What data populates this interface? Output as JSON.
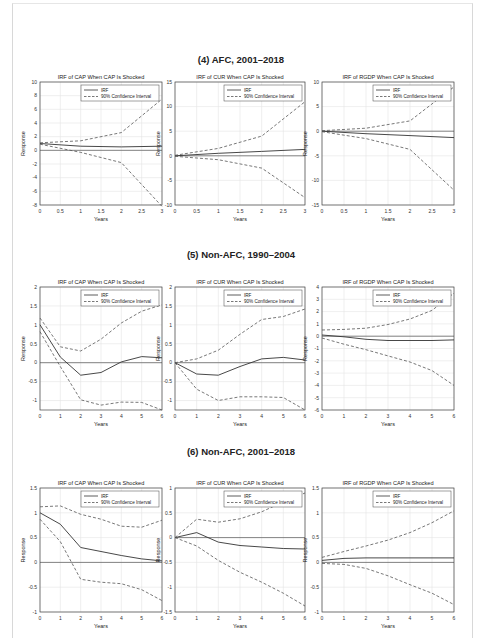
{
  "sections": [
    {
      "title": "(4) AFC, 2001–2018"
    },
    {
      "title": "(5) Non-AFC, 1990–2004"
    },
    {
      "title": "(6) Non-AFC, 2001–2018"
    }
  ],
  "legend": {
    "irf": "IRF",
    "ci": "90% Confidence Interval"
  },
  "chart_data": [
    {
      "type": "line",
      "section": "(4) AFC, 2001–2018",
      "title": "IRF of CAP When CAP Is Shocked",
      "xlabel": "Years",
      "ylabel": "Response",
      "xlim": [
        0,
        3
      ],
      "ylim": [
        -8,
        10
      ],
      "xticks": [
        0,
        0.5,
        1,
        1.5,
        2,
        2.5,
        3
      ],
      "yticks": [
        -8,
        -6,
        -4,
        -2,
        0,
        2,
        4,
        6,
        8,
        10
      ],
      "grid": true,
      "legend_position": "upper right",
      "x": [
        0,
        1,
        2,
        3
      ],
      "series": [
        {
          "name": "IRF",
          "values": [
            1,
            0.6,
            0.5,
            0.6
          ]
        },
        {
          "name": "90% Confidence Interval (upper)",
          "values": [
            1.1,
            1.4,
            2.6,
            7.5
          ]
        },
        {
          "name": "90% Confidence Interval (lower)",
          "values": [
            0.9,
            -0.3,
            -1.8,
            -8.2
          ]
        }
      ]
    },
    {
      "type": "line",
      "section": "(4) AFC, 2001–2018",
      "title": "IRF of CUR When CAP Is Shocked",
      "xlabel": "Years",
      "ylabel": "Response",
      "xlim": [
        0,
        3
      ],
      "ylim": [
        -10,
        15
      ],
      "xticks": [
        0,
        0.5,
        1,
        1.5,
        2,
        2.5,
        3
      ],
      "yticks": [
        -10,
        -5,
        0,
        5,
        10,
        15
      ],
      "grid": true,
      "legend_position": "upper right",
      "x": [
        0,
        1,
        2,
        3
      ],
      "series": [
        {
          "name": "IRF",
          "values": [
            0,
            0.5,
            0.9,
            1.3
          ]
        },
        {
          "name": "90% Confidence Interval (upper)",
          "values": [
            0.1,
            1.5,
            4,
            11
          ]
        },
        {
          "name": "90% Confidence Interval (lower)",
          "values": [
            -0.1,
            -0.8,
            -2.5,
            -8.5
          ]
        }
      ]
    },
    {
      "type": "line",
      "section": "(4) AFC, 2001–2018",
      "title": "IRF of RGDP When CAP Is Shocked",
      "xlabel": "Years",
      "ylabel": "Response",
      "xlim": [
        0,
        3
      ],
      "ylim": [
        -15,
        10
      ],
      "xticks": [
        0,
        0.5,
        1,
        1.5,
        2,
        2.5,
        3
      ],
      "yticks": [
        -15,
        -10,
        -5,
        0,
        5,
        10
      ],
      "grid": true,
      "legend_position": "upper right",
      "x": [
        0,
        1,
        2,
        3
      ],
      "series": [
        {
          "name": "IRF",
          "values": [
            0,
            -0.5,
            -0.9,
            -1.3
          ]
        },
        {
          "name": "90% Confidence Interval (upper)",
          "values": [
            0.1,
            0.6,
            2.1,
            9
          ]
        },
        {
          "name": "90% Confidence Interval (lower)",
          "values": [
            -0.1,
            -1.5,
            -3.7,
            -12
          ]
        }
      ]
    },
    {
      "type": "line",
      "section": "(5) Non-AFC, 1990–2004",
      "title": "IRF of CAP When CAP Is Shocked",
      "xlabel": "Years",
      "ylabel": "Response",
      "xlim": [
        0,
        6
      ],
      "ylim": [
        -1.25,
        2
      ],
      "xticks": [
        0,
        1,
        2,
        3,
        4,
        5,
        6
      ],
      "yticks": [
        -1,
        -0.5,
        0,
        0.5,
        1,
        1.5,
        2
      ],
      "grid": true,
      "legend_position": "upper right",
      "x": [
        0,
        1,
        2,
        3,
        4,
        5,
        6
      ],
      "series": [
        {
          "name": "IRF",
          "values": [
            1,
            0.15,
            -0.33,
            -0.26,
            0.02,
            0.16,
            0.13
          ]
        },
        {
          "name": "90% Confidence Interval (upper)",
          "values": [
            1.18,
            0.42,
            0.31,
            0.62,
            1.05,
            1.36,
            1.53
          ]
        },
        {
          "name": "90% Confidence Interval (lower)",
          "values": [
            0.82,
            -0.1,
            -0.98,
            -1.12,
            -1.04,
            -1.05,
            -1.25
          ]
        }
      ]
    },
    {
      "type": "line",
      "section": "(5) Non-AFC, 1990–2004",
      "title": "IRF of CUR When CAP Is Shocked",
      "xlabel": "Years",
      "ylabel": "Response",
      "xlim": [
        0,
        6
      ],
      "ylim": [
        -1.25,
        2
      ],
      "xticks": [
        0,
        1,
        2,
        3,
        4,
        5,
        6
      ],
      "yticks": [
        -1,
        -0.5,
        0,
        0.5,
        1,
        1.5,
        2
      ],
      "grid": true,
      "legend_position": "upper right",
      "x": [
        0,
        1,
        2,
        3,
        4,
        5,
        6
      ],
      "series": [
        {
          "name": "IRF",
          "values": [
            0,
            -0.3,
            -0.33,
            -0.1,
            0.1,
            0.14,
            0.07
          ]
        },
        {
          "name": "90% Confidence Interval (upper)",
          "values": [
            0,
            0.1,
            0.33,
            0.75,
            1.14,
            1.22,
            1.42
          ]
        },
        {
          "name": "90% Confidence Interval (lower)",
          "values": [
            0,
            -0.7,
            -1,
            -0.9,
            -0.9,
            -0.92,
            -1.25
          ]
        }
      ]
    },
    {
      "type": "line",
      "section": "(5) Non-AFC, 1990–2004",
      "title": "IRF of RGDP When CAP Is Shocked",
      "xlabel": "Years",
      "ylabel": "Response",
      "xlim": [
        0,
        6
      ],
      "ylim": [
        -6,
        4
      ],
      "xticks": [
        0,
        1,
        2,
        3,
        4,
        5,
        6
      ],
      "yticks": [
        -6,
        -5,
        -4,
        -3,
        -2,
        -1,
        0,
        1,
        2,
        3,
        4
      ],
      "grid": true,
      "legend_position": "upper right",
      "x": [
        0,
        1,
        2,
        3,
        4,
        5,
        6
      ],
      "series": [
        {
          "name": "IRF",
          "values": [
            0.1,
            -0.05,
            -0.25,
            -0.35,
            -0.35,
            -0.35,
            -0.3
          ]
        },
        {
          "name": "90% Confidence Interval (upper)",
          "values": [
            0.5,
            0.55,
            0.65,
            0.95,
            1.4,
            2.1,
            3.5
          ]
        },
        {
          "name": "90% Confidence Interval (lower)",
          "values": [
            -0.15,
            -0.65,
            -1.1,
            -1.6,
            -2.1,
            -2.8,
            -4
          ]
        }
      ]
    },
    {
      "type": "line",
      "section": "(6) Non-AFC, 2001–2018",
      "title": "IRF of CAP When CAP Is Shocked",
      "xlabel": "Years",
      "ylabel": "Response",
      "xlim": [
        0,
        6
      ],
      "ylim": [
        -1,
        1.5
      ],
      "xticks": [
        0,
        1,
        2,
        3,
        4,
        5,
        6
      ],
      "yticks": [
        -1,
        -0.5,
        0,
        0.5,
        1,
        1.5
      ],
      "grid": true,
      "legend_position": "upper right",
      "x": [
        0,
        1,
        2,
        3,
        4,
        5,
        6
      ],
      "series": [
        {
          "name": "IRF",
          "values": [
            1,
            0.77,
            0.3,
            0.22,
            0.14,
            0.07,
            0.03
          ]
        },
        {
          "name": "90% Confidence Interval (upper)",
          "values": [
            1.12,
            1.14,
            0.97,
            0.87,
            0.73,
            0.71,
            0.85
          ]
        },
        {
          "name": "90% Confidence Interval (lower)",
          "values": [
            0.87,
            0.42,
            -0.34,
            -0.4,
            -0.43,
            -0.55,
            -0.77
          ]
        }
      ]
    },
    {
      "type": "line",
      "section": "(6) Non-AFC, 2001–2018",
      "title": "IRF of CUR When CAP Is Shocked",
      "xlabel": "Years",
      "ylabel": "Response",
      "xlim": [
        0,
        6
      ],
      "ylim": [
        -1.5,
        1
      ],
      "xticks": [
        0,
        1,
        2,
        3,
        4,
        5,
        6
      ],
      "yticks": [
        -1.5,
        -1,
        -0.5,
        0,
        0.5,
        1
      ],
      "grid": true,
      "legend_position": "upper right",
      "x": [
        0,
        1,
        2,
        3,
        4,
        5,
        6
      ],
      "series": [
        {
          "name": "IRF",
          "values": [
            0,
            0.1,
            -0.09,
            -0.16,
            -0.19,
            -0.22,
            -0.23
          ]
        },
        {
          "name": "90% Confidence Interval (upper)",
          "values": [
            0,
            0.37,
            0.31,
            0.38,
            0.52,
            0.72,
            0.9
          ]
        },
        {
          "name": "90% Confidence Interval (lower)",
          "values": [
            0,
            -0.17,
            -0.46,
            -0.7,
            -0.9,
            -1.12,
            -1.38
          ]
        }
      ]
    },
    {
      "type": "line",
      "section": "(6) Non-AFC, 2001–2018",
      "title": "IRF of RGDP When CAP Is Shocked",
      "xlabel": "Years",
      "ylabel": "Response",
      "xlim": [
        0,
        6
      ],
      "ylim": [
        -1,
        1.5
      ],
      "xticks": [
        0,
        1,
        2,
        3,
        4,
        5,
        6
      ],
      "yticks": [
        -1,
        -0.5,
        0,
        0.5,
        1,
        1.5
      ],
      "grid": true,
      "legend_position": "upper right",
      "x": [
        0,
        1,
        2,
        3,
        4,
        5,
        6
      ],
      "series": [
        {
          "name": "IRF",
          "values": [
            0.04,
            0.08,
            0.09,
            0.09,
            0.09,
            0.09,
            0.09
          ]
        },
        {
          "name": "90% Confidence Interval (upper)",
          "values": [
            0.1,
            0.22,
            0.33,
            0.45,
            0.6,
            0.8,
            1.04
          ]
        },
        {
          "name": "90% Confidence Interval (lower)",
          "values": [
            -0.02,
            -0.04,
            -0.12,
            -0.27,
            -0.45,
            -0.62,
            -0.85
          ]
        }
      ]
    }
  ]
}
